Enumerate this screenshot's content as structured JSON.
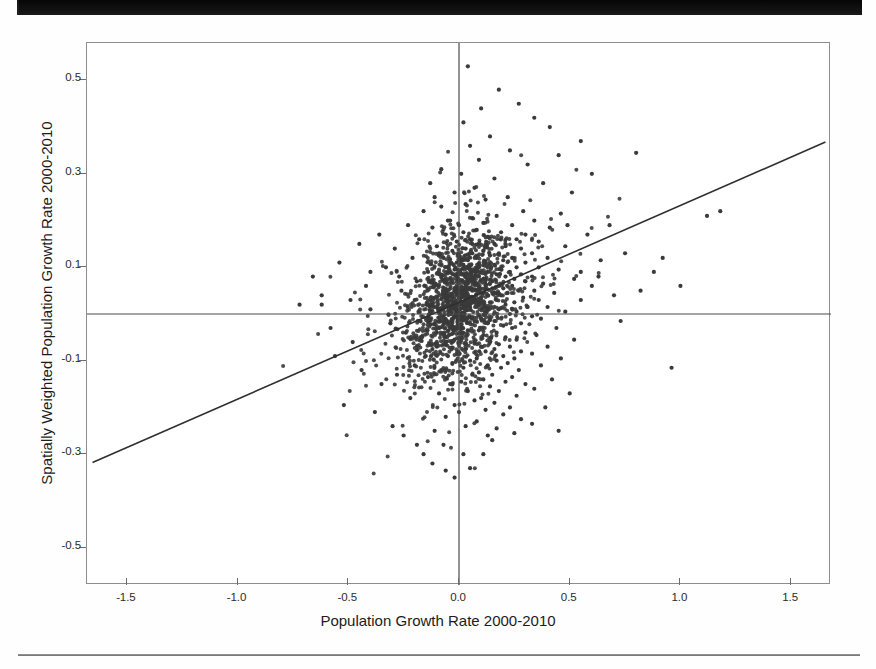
{
  "page": {
    "artifacts": {
      "top_bar_name": "scanned-page-black-margin",
      "bottom_rule_name": "scanned-page-footer-rule"
    }
  },
  "chart_data": {
    "type": "scatter",
    "title": "",
    "xlabel": "Population Growth Rate 2000-2010",
    "ylabel": "Spatially Weighted Population Growth Rate 2000-2010",
    "xlim": [
      -1.68,
      1.68
    ],
    "ylim": [
      -0.58,
      0.58
    ],
    "xticks": [
      -1.5,
      -1.0,
      -0.5,
      0.0,
      0.5,
      1.0,
      1.5
    ],
    "xticklabels": [
      "-1.5",
      "-1.0",
      "-0.5",
      "0.0",
      "0.5",
      "1.0",
      "1.5"
    ],
    "yticks": [
      0.5,
      0.3,
      0.1,
      -0.1,
      -0.3,
      -0.5
    ],
    "yticklabels": [
      "0.5",
      "0.3",
      "0.1",
      "-0.1",
      "-0.3",
      "-0.5"
    ],
    "grid": false,
    "legend": null,
    "marker": {
      "shape": "circle",
      "size_px": 4,
      "color": "#3a3a3a"
    },
    "reference_lines": [
      {
        "name": "vertical-zero-line",
        "orientation": "vertical",
        "value": 0.0,
        "color": "#4a4a4a"
      },
      {
        "name": "horizontal-zero-line",
        "orientation": "horizontal",
        "value": 0.0,
        "color": "#4a4a4a"
      }
    ],
    "fit_line": {
      "name": "regression-line",
      "type": "linear",
      "color": "#2f2f2f",
      "x_start": -1.655,
      "y_start": -0.318,
      "x_end": 1.655,
      "y_end": 0.368,
      "slope": 0.2073,
      "intercept": 0.0247
    },
    "points": [
      [
        0.04,
        0.53
      ],
      [
        0.18,
        0.48
      ],
      [
        0.27,
        0.45
      ],
      [
        0.1,
        0.44
      ],
      [
        0.34,
        0.42
      ],
      [
        0.41,
        0.4
      ],
      [
        0.02,
        0.41
      ],
      [
        0.14,
        0.38
      ],
      [
        0.55,
        0.37
      ],
      [
        0.05,
        0.36
      ],
      [
        0.23,
        0.35
      ],
      [
        0.45,
        0.34
      ],
      [
        0.8,
        0.345
      ],
      [
        0.31,
        0.32
      ],
      [
        0.09,
        0.33
      ],
      [
        0.01,
        0.3
      ],
      [
        0.16,
        0.29
      ],
      [
        0.6,
        0.3
      ],
      [
        0.38,
        0.28
      ],
      [
        0.07,
        0.27
      ],
      [
        -0.02,
        0.26
      ],
      [
        0.51,
        0.26
      ],
      [
        0.22,
        0.25
      ],
      [
        0.12,
        0.245
      ],
      [
        0.03,
        0.235
      ],
      [
        -0.08,
        0.23
      ],
      [
        0.29,
        0.22
      ],
      [
        1.18,
        0.22
      ],
      [
        0.46,
        0.215
      ],
      [
        0.17,
        0.21
      ],
      [
        0.06,
        0.205
      ],
      [
        -0.04,
        0.2
      ],
      [
        0.34,
        0.2
      ],
      [
        0.11,
        0.195
      ],
      [
        0.24,
        0.19
      ],
      [
        0.0,
        0.19
      ],
      [
        -0.12,
        0.185
      ],
      [
        0.41,
        0.185
      ],
      [
        0.08,
        0.18
      ],
      [
        0.19,
        0.175
      ],
      [
        0.02,
        0.175
      ],
      [
        0.3,
        0.17
      ],
      [
        -0.06,
        0.17
      ],
      [
        0.13,
        0.165
      ],
      [
        0.05,
        0.16
      ],
      [
        0.26,
        0.16
      ],
      [
        -0.01,
        0.155
      ],
      [
        0.36,
        0.155
      ],
      [
        0.09,
        0.15
      ],
      [
        0.16,
        0.15
      ],
      [
        -0.1,
        0.145
      ],
      [
        0.21,
        0.145
      ],
      [
        0.03,
        0.14
      ],
      [
        0.48,
        0.145
      ],
      [
        0.28,
        0.14
      ],
      [
        0.11,
        0.135
      ],
      [
        -0.03,
        0.135
      ],
      [
        0.06,
        0.13
      ],
      [
        0.18,
        0.13
      ],
      [
        0.33,
        0.13
      ],
      [
        0.0,
        0.125
      ],
      [
        0.14,
        0.125
      ],
      [
        -0.07,
        0.12
      ],
      [
        0.24,
        0.12
      ],
      [
        0.08,
        0.12
      ],
      [
        0.4,
        0.12
      ],
      [
        0.04,
        0.115
      ],
      [
        0.2,
        0.115
      ],
      [
        -0.01,
        0.11
      ],
      [
        0.3,
        0.11
      ],
      [
        0.12,
        0.11
      ],
      [
        0.64,
        0.115
      ],
      [
        0.02,
        0.105
      ],
      [
        0.16,
        0.105
      ],
      [
        -0.05,
        0.1
      ],
      [
        0.26,
        0.1
      ],
      [
        0.09,
        0.1
      ],
      [
        0.36,
        0.1
      ],
      [
        0.05,
        0.095
      ],
      [
        0.19,
        0.095
      ],
      [
        -0.02,
        0.095
      ],
      [
        0.23,
        0.09
      ],
      [
        0.13,
        0.09
      ],
      [
        0.45,
        0.095
      ],
      [
        0.01,
        0.085
      ],
      [
        0.17,
        0.085
      ],
      [
        -0.09,
        0.085
      ],
      [
        0.28,
        0.085
      ],
      [
        0.07,
        0.08
      ],
      [
        0.33,
        0.08
      ],
      [
        0.03,
        0.08
      ],
      [
        0.21,
        0.08
      ],
      [
        -0.04,
        0.075
      ],
      [
        0.25,
        0.075
      ],
      [
        0.11,
        0.075
      ],
      [
        0.52,
        0.075
      ],
      [
        0.0,
        0.07
      ],
      [
        0.15,
        0.07
      ],
      [
        -0.06,
        0.07
      ],
      [
        0.3,
        0.07
      ],
      [
        0.08,
        0.065
      ],
      [
        0.38,
        0.065
      ],
      [
        0.04,
        0.065
      ],
      [
        0.18,
        0.06
      ],
      [
        -0.11,
        0.06
      ],
      [
        0.24,
        0.06
      ],
      [
        0.12,
        0.06
      ],
      [
        0.6,
        0.06
      ],
      [
        0.02,
        0.055
      ],
      [
        0.2,
        0.055
      ],
      [
        -0.02,
        0.055
      ],
      [
        0.27,
        0.05
      ],
      [
        0.09,
        0.05
      ],
      [
        0.34,
        0.05
      ],
      [
        0.06,
        0.05
      ],
      [
        0.16,
        0.045
      ],
      [
        -0.07,
        0.045
      ],
      [
        0.22,
        0.045
      ],
      [
        0.13,
        0.04
      ],
      [
        0.43,
        0.045
      ],
      [
        0.01,
        0.04
      ],
      [
        0.19,
        0.04
      ],
      [
        -0.03,
        0.035
      ],
      [
        0.29,
        0.035
      ],
      [
        0.1,
        0.035
      ],
      [
        0.36,
        0.03
      ],
      [
        0.05,
        0.03
      ],
      [
        0.17,
        0.03
      ],
      [
        -0.13,
        0.03
      ],
      [
        0.25,
        0.025
      ],
      [
        0.14,
        0.025
      ],
      [
        0.55,
        0.03
      ],
      [
        0.0,
        0.02
      ],
      [
        0.21,
        0.02
      ],
      [
        -0.05,
        0.02
      ],
      [
        0.31,
        0.015
      ],
      [
        0.08,
        0.015
      ],
      [
        0.4,
        0.015
      ],
      [
        0.03,
        0.01
      ],
      [
        0.18,
        0.01
      ],
      [
        -0.09,
        0.01
      ],
      [
        0.26,
        0.005
      ],
      [
        0.12,
        0.005
      ],
      [
        0.48,
        0.005
      ],
      [
        0.02,
        0.0
      ],
      [
        0.23,
        0.0
      ],
      [
        -0.01,
        -0.005
      ],
      [
        0.33,
        -0.005
      ],
      [
        0.1,
        -0.01
      ],
      [
        0.37,
        -0.01
      ],
      [
        0.06,
        -0.01
      ],
      [
        0.16,
        -0.015
      ],
      [
        -0.06,
        -0.015
      ],
      [
        0.28,
        -0.02
      ],
      [
        0.13,
        -0.02
      ],
      [
        0.73,
        -0.015
      ],
      [
        0.0,
        -0.025
      ],
      [
        0.2,
        -0.025
      ],
      [
        -0.04,
        -0.03
      ],
      [
        0.24,
        -0.03
      ],
      [
        0.09,
        -0.035
      ],
      [
        0.44,
        -0.03
      ],
      [
        0.04,
        -0.035
      ],
      [
        0.17,
        -0.04
      ],
      [
        -0.1,
        -0.04
      ],
      [
        0.3,
        -0.04
      ],
      [
        0.11,
        -0.045
      ],
      [
        0.35,
        -0.045
      ],
      [
        0.01,
        -0.05
      ],
      [
        0.21,
        -0.05
      ],
      [
        -0.02,
        -0.055
      ],
      [
        0.26,
        -0.055
      ],
      [
        0.14,
        -0.06
      ],
      [
        0.52,
        -0.055
      ],
      [
        0.07,
        -0.06
      ],
      [
        0.18,
        -0.065
      ],
      [
        -0.07,
        -0.065
      ],
      [
        0.23,
        -0.07
      ],
      [
        0.1,
        -0.07
      ],
      [
        0.4,
        -0.07
      ],
      [
        0.03,
        -0.075
      ],
      [
        0.16,
        -0.075
      ],
      [
        -0.12,
        -0.075
      ],
      [
        0.28,
        -0.08
      ],
      [
        0.12,
        -0.08
      ],
      [
        0.33,
        -0.085
      ],
      [
        0.0,
        -0.085
      ],
      [
        0.2,
        -0.09
      ],
      [
        -0.05,
        -0.09
      ],
      [
        0.25,
        -0.095
      ],
      [
        0.08,
        -0.095
      ],
      [
        0.46,
        -0.095
      ],
      [
        0.05,
        -0.1
      ],
      [
        0.17,
        -0.1
      ],
      [
        -0.03,
        -0.105
      ],
      [
        0.22,
        -0.105
      ],
      [
        0.13,
        -0.11
      ],
      [
        0.37,
        -0.11
      ],
      [
        0.02,
        -0.115
      ],
      [
        0.19,
        -0.115
      ],
      [
        -0.08,
        -0.12
      ],
      [
        0.27,
        -0.12
      ],
      [
        0.09,
        -0.125
      ],
      [
        0.96,
        -0.115
      ],
      [
        0.06,
        -0.13
      ],
      [
        0.15,
        -0.13
      ],
      [
        -0.14,
        -0.135
      ],
      [
        0.24,
        -0.135
      ],
      [
        0.11,
        -0.14
      ],
      [
        0.42,
        -0.14
      ],
      [
        0.01,
        -0.145
      ],
      [
        0.21,
        -0.145
      ],
      [
        -0.04,
        -0.15
      ],
      [
        0.3,
        -0.15
      ],
      [
        0.14,
        -0.155
      ],
      [
        0.34,
        -0.16
      ],
      [
        0.04,
        -0.165
      ],
      [
        0.18,
        -0.165
      ],
      [
        -0.09,
        -0.17
      ],
      [
        0.26,
        -0.175
      ],
      [
        0.1,
        -0.18
      ],
      [
        0.5,
        -0.17
      ],
      [
        0.07,
        -0.185
      ],
      [
        0.16,
        -0.19
      ],
      [
        -0.02,
        -0.195
      ],
      [
        0.23,
        -0.2
      ],
      [
        0.12,
        -0.205
      ],
      [
        0.39,
        -0.2
      ],
      [
        0.0,
        -0.21
      ],
      [
        0.2,
        -0.215
      ],
      [
        -0.06,
        -0.22
      ],
      [
        0.28,
        -0.225
      ],
      [
        0.08,
        -0.23
      ],
      [
        0.33,
        -0.235
      ],
      [
        0.03,
        -0.24
      ],
      [
        0.17,
        -0.245
      ],
      [
        -0.11,
        -0.25
      ],
      [
        0.25,
        -0.255
      ],
      [
        0.13,
        -0.26
      ],
      [
        0.45,
        -0.25
      ],
      [
        -0.38,
        -0.21
      ],
      [
        -0.52,
        -0.195
      ],
      [
        -0.3,
        -0.24
      ],
      [
        -0.25,
        -0.26
      ],
      [
        -0.19,
        -0.28
      ],
      [
        -0.16,
        -0.3
      ],
      [
        -0.12,
        -0.32
      ],
      [
        -0.06,
        -0.335
      ],
      [
        -0.02,
        -0.35
      ],
      [
        0.05,
        -0.33
      ],
      [
        0.11,
        -0.3
      ],
      [
        0.02,
        -0.3
      ],
      [
        -0.07,
        -0.28
      ],
      [
        0.15,
        -0.27
      ],
      [
        -0.22,
        -0.18
      ],
      [
        -0.35,
        -0.15
      ],
      [
        -0.44,
        -0.12
      ],
      [
        -0.56,
        -0.09
      ],
      [
        -0.28,
        -0.13
      ],
      [
        -0.2,
        -0.11
      ],
      [
        -0.15,
        -0.09
      ],
      [
        -0.1,
        -0.07
      ],
      [
        -0.17,
        -0.05
      ],
      [
        -0.24,
        -0.04
      ],
      [
        -0.31,
        -0.02
      ],
      [
        -0.4,
        0.01
      ],
      [
        -0.49,
        0.03
      ],
      [
        -0.62,
        0.02
      ],
      [
        -0.26,
        0.05
      ],
      [
        -0.19,
        0.07
      ],
      [
        -0.14,
        0.09
      ],
      [
        -0.21,
        0.12
      ],
      [
        -0.29,
        0.14
      ],
      [
        -0.36,
        0.17
      ],
      [
        -0.45,
        0.15
      ],
      [
        -0.33,
        0.1
      ],
      [
        -0.18,
        0.16
      ],
      [
        -0.23,
        0.19
      ],
      [
        -0.16,
        0.22
      ],
      [
        -0.11,
        0.25
      ],
      [
        -0.27,
        0.08
      ],
      [
        -0.42,
        0.06
      ],
      [
        -0.54,
        0.11
      ],
      [
        -0.13,
        0.28
      ],
      [
        -0.08,
        0.31
      ],
      [
        -0.05,
        0.2
      ],
      [
        -0.09,
        0.13
      ],
      [
        -0.2,
        0.03
      ],
      [
        0.68,
        0.19
      ],
      [
        0.75,
        0.13
      ],
      [
        0.88,
        0.09
      ],
      [
        1.0,
        0.06
      ],
      [
        1.12,
        0.21
      ],
      [
        0.82,
        0.05
      ],
      [
        0.58,
        0.17
      ],
      [
        0.63,
        0.08
      ],
      [
        0.7,
        0.04
      ],
      [
        0.92,
        0.12
      ],
      [
        0.55,
        0.09
      ],
      [
        0.49,
        0.19
      ],
      [
        -0.62,
        0.04
      ],
      [
        -0.72,
        0.02
      ],
      [
        -0.58,
        -0.03
      ],
      [
        -0.48,
        -0.06
      ],
      [
        -0.66,
        0.08
      ],
      [
        -0.4,
        0.09
      ]
    ],
    "point_count_note": "dense cluster concentrated near origin"
  }
}
